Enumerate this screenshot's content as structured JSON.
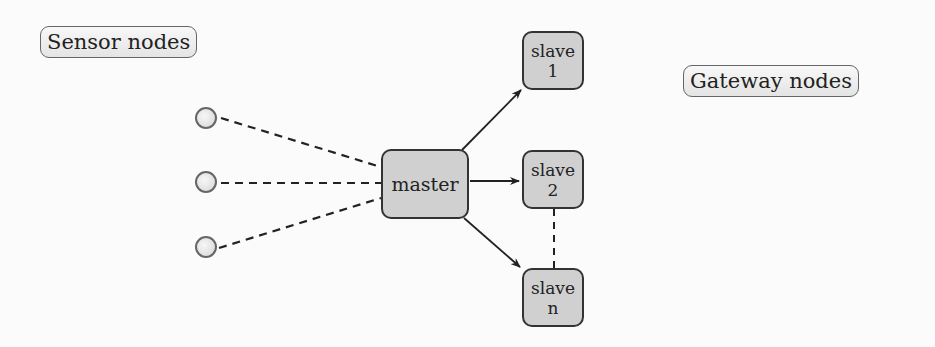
{
  "labels": {
    "sensor_nodes": "Sensor nodes",
    "gateway_nodes": "Gateway nodes"
  },
  "nodes": {
    "master": {
      "label": "master"
    },
    "slave1": {
      "line1": "slave",
      "line2": "1"
    },
    "slave2": {
      "line1": "slave",
      "line2": "2"
    },
    "slaven": {
      "line1": "slave",
      "line2": "n"
    }
  },
  "sensors": [
    {
      "id": "sensor-1"
    },
    {
      "id": "sensor-2"
    },
    {
      "id": "sensor-3"
    }
  ],
  "edges": [
    {
      "from": "sensor-1",
      "to": "master",
      "style": "dashed"
    },
    {
      "from": "sensor-2",
      "to": "master",
      "style": "dashed"
    },
    {
      "from": "sensor-3",
      "to": "master",
      "style": "dashed"
    },
    {
      "from": "master",
      "to": "slave1",
      "style": "arrow"
    },
    {
      "from": "master",
      "to": "slave2",
      "style": "arrow"
    },
    {
      "from": "master",
      "to": "slaven",
      "style": "arrow"
    },
    {
      "from": "slave2",
      "to": "slaven",
      "style": "dashed"
    }
  ],
  "colors": {
    "node_fill": "#d0d0d0",
    "node_border": "#333333",
    "sensor_border": "#666666"
  }
}
